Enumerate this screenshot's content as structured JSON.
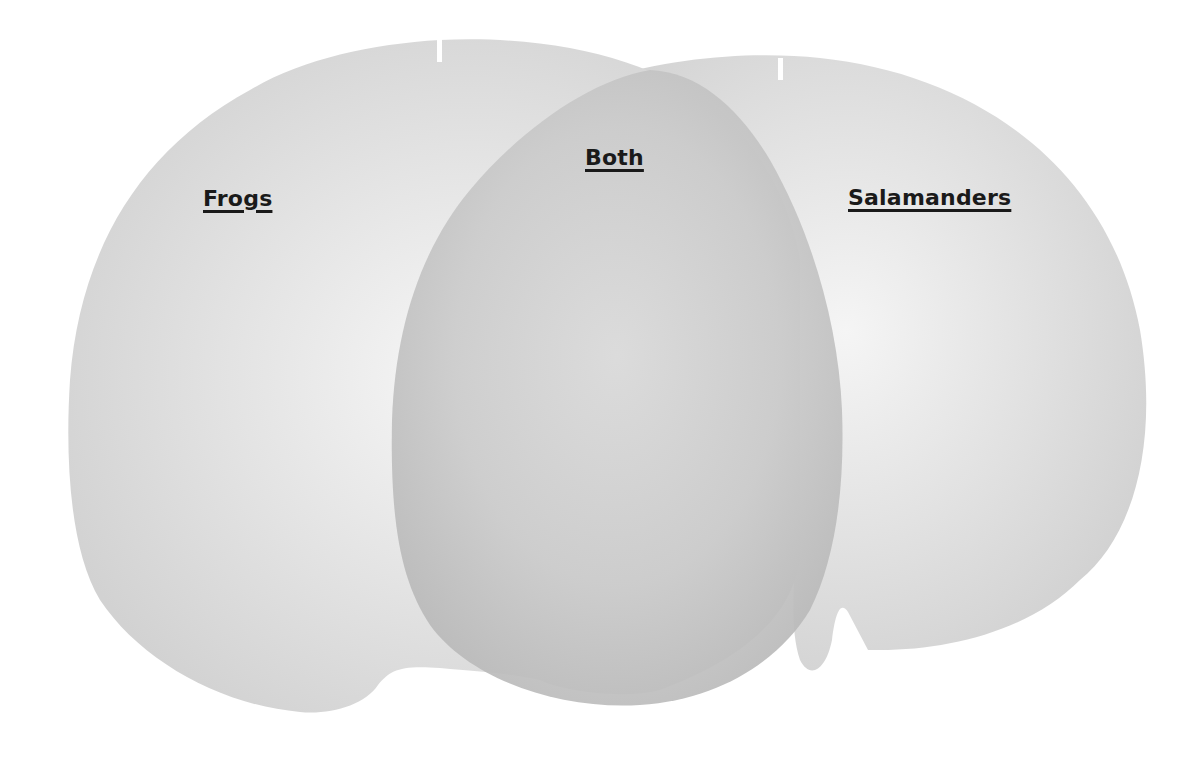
{
  "diagram": {
    "type": "venn",
    "sets": [
      {
        "id": "left",
        "label": "Frogs",
        "color": "#d9d9d9"
      },
      {
        "id": "overlap",
        "label": "Both",
        "color": "#c4c4c4"
      },
      {
        "id": "right",
        "label": "Salamanders",
        "color": "#d9d9d9"
      }
    ]
  },
  "labels": {
    "left": "Frogs",
    "center": "Both",
    "right": "Salamanders"
  },
  "colors": {
    "background": "#ffffff",
    "shape_fill": "#d6d6d6",
    "shape_highlight": "#f2f2f2",
    "overlap_fill": "#bdbdbd",
    "overlap_highlight": "#d8d8d8",
    "text": "#1a1a1a"
  }
}
